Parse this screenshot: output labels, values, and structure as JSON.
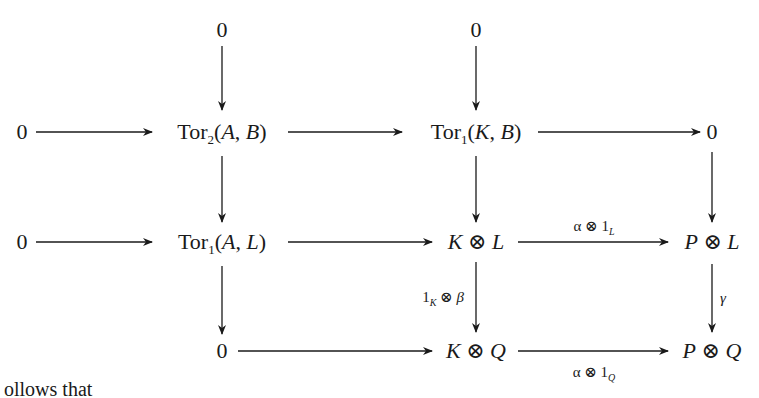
{
  "diagram": {
    "type": "commutative-diagram",
    "nodes": {
      "top_zero_1": "0",
      "top_zero_2": "0",
      "r1_zero_left": "0",
      "r1_tor2_AB": {
        "op": "Tor",
        "sub": "2",
        "args": [
          "A",
          "B"
        ]
      },
      "r1_tor1_KB": {
        "op": "Tor",
        "sub": "1",
        "args": [
          "K",
          "B"
        ]
      },
      "r1_zero_right": "0",
      "r2_zero_left": "0",
      "r2_tor1_AL": {
        "op": "Tor",
        "sub": "1",
        "args": [
          "A",
          "L"
        ]
      },
      "r2_K_tensor_L": {
        "left": "K",
        "op": "⊗",
        "right": "L"
      },
      "r2_P_tensor_L": {
        "left": "P",
        "op": "⊗",
        "right": "L"
      },
      "r3_zero": "0",
      "r3_K_tensor_Q": {
        "left": "K",
        "op": "⊗",
        "right": "Q"
      },
      "r3_P_tensor_Q": {
        "left": "P",
        "op": "⊗",
        "right": "Q"
      }
    },
    "arrow_labels": {
      "alpha_1L": {
        "base": "α ⊗ 1",
        "sub": "L"
      },
      "one_K_beta": {
        "base": "1",
        "sub": "K",
        "rest": " ⊗ β"
      },
      "gamma": "γ",
      "alpha_1Q": {
        "base": "α ⊗ 1",
        "sub": "Q"
      }
    },
    "text": {
      "zero": "0",
      "tor": "Tor",
      "comma": ", ",
      "lparen": "(",
      "rparen": ")",
      "otimes": " ⊗ "
    },
    "partial_caption": "ollows that"
  }
}
